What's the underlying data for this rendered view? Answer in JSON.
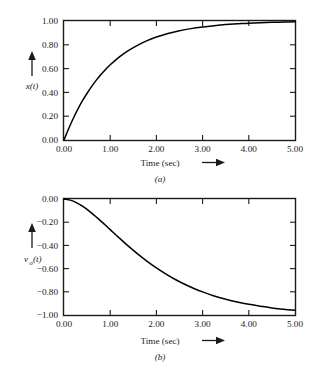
{
  "figure": {
    "background_color": "#ffffff",
    "line_color": "#000000",
    "text_color": "#1a1a1a"
  },
  "chart_data": [
    {
      "type": "line",
      "panel_label": "(a)",
      "title": "",
      "xlabel": "Time (sec)",
      "xlabel_arrow": "⟶",
      "ylabel": "x(t)",
      "ylabel_arrow": "↑",
      "xlim": [
        0.0,
        5.0
      ],
      "ylim": [
        0.0,
        1.0
      ],
      "grid": false,
      "legend": "none",
      "xticks": [
        0.0,
        1.0,
        2.0,
        3.0,
        4.0,
        5.0
      ],
      "xticklabels": [
        "0.00",
        "1.00",
        "2.00",
        "3.00",
        "4.00",
        "5.00"
      ],
      "yticks": [
        0.0,
        0.2,
        0.4,
        0.6,
        0.8,
        1.0
      ],
      "yticklabels": [
        "0.00",
        "0.20",
        "0.40",
        "0.60",
        "0.80",
        "1.00"
      ],
      "series": [
        {
          "name": "x(t)",
          "description": "rising exponential step response, 1 - e^(-t)",
          "x": [
            0.0,
            0.1,
            0.2,
            0.3,
            0.4,
            0.5,
            0.6,
            0.7,
            0.8,
            0.9,
            1.0,
            1.2,
            1.4,
            1.6,
            1.8,
            2.0,
            2.25,
            2.5,
            2.75,
            3.0,
            3.25,
            3.5,
            3.75,
            4.0,
            4.25,
            4.5,
            4.75,
            5.0
          ],
          "y": [
            0.0,
            0.095,
            0.181,
            0.259,
            0.33,
            0.393,
            0.451,
            0.503,
            0.551,
            0.593,
            0.632,
            0.699,
            0.753,
            0.798,
            0.835,
            0.865,
            0.895,
            0.918,
            0.936,
            0.95,
            0.961,
            0.97,
            0.976,
            0.982,
            0.986,
            0.989,
            0.991,
            0.993
          ]
        }
      ]
    },
    {
      "type": "line",
      "panel_label": "(b)",
      "title": "",
      "xlabel": "Time (sec)",
      "xlabel_arrow": "⟶",
      "ylabel": "v",
      "ylabel_subscript": "o",
      "ylabel_suffix": "(t)",
      "ylabel_arrow": "↑",
      "xlim": [
        0.0,
        5.0
      ],
      "ylim": [
        -1.0,
        0.0
      ],
      "grid": false,
      "legend": "none",
      "xticks": [
        0.0,
        1.0,
        2.0,
        3.0,
        4.0,
        5.0
      ],
      "xticklabels": [
        "0.00",
        "1.00",
        "2.00",
        "3.00",
        "4.00",
        "5.00"
      ],
      "yticks": [
        -1.0,
        -0.8,
        -0.6,
        -0.4,
        -0.2,
        0.0
      ],
      "yticklabels": [
        "−1.00",
        "−0.80",
        "−0.60",
        "−0.40",
        "−0.20",
        "0.00"
      ],
      "series": [
        {
          "name": "v_o(t)",
          "description": "falling S-shaped response with zero initial slope, -(1-(1+t)e^(-t))",
          "x": [
            0.0,
            0.2,
            0.4,
            0.6,
            0.8,
            1.0,
            1.2,
            1.4,
            1.6,
            1.8,
            2.0,
            2.2,
            2.4,
            2.6,
            2.8,
            3.0,
            3.25,
            3.5,
            3.75,
            4.0,
            4.25,
            4.5,
            4.75,
            5.0
          ],
          "y": [
            0.0,
            -0.018,
            -0.062,
            -0.122,
            -0.191,
            -0.264,
            -0.337,
            -0.408,
            -0.475,
            -0.537,
            -0.594,
            -0.645,
            -0.692,
            -0.733,
            -0.769,
            -0.801,
            -0.836,
            -0.864,
            -0.888,
            -0.908,
            -0.924,
            -0.939,
            -0.95,
            -0.96
          ]
        }
      ]
    }
  ]
}
